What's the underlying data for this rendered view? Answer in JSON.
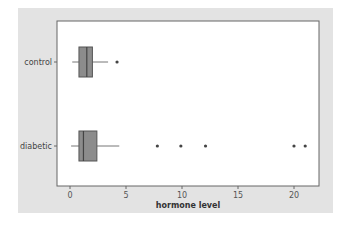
{
  "chart_data": {
    "type": "boxplot",
    "orientation": "horizontal",
    "title": "",
    "xlabel": "hormone level",
    "ylabel": "",
    "xlim": [
      -1,
      22.2
    ],
    "xticks": [
      0,
      5,
      10,
      15,
      20
    ],
    "xtick_labels": [
      "0",
      "5",
      "10",
      "15",
      "20"
    ],
    "grid": false,
    "categories": [
      "control",
      "diabetic"
    ],
    "series": [
      {
        "name": "control",
        "whisker_low": 0.2,
        "q1": 0.8,
        "median": 1.5,
        "q3": 2.0,
        "whisker_high": 3.4,
        "outliers": [
          4.2
        ]
      },
      {
        "name": "diabetic",
        "whisker_low": 0.1,
        "q1": 0.8,
        "median": 1.2,
        "q3": 2.4,
        "whisker_high": 4.4,
        "outliers": [
          7.8,
          9.9,
          12.1,
          20.0,
          21.0
        ]
      }
    ],
    "colors": {
      "panel_bg": "#e3e3e3",
      "plot_bg": "#ffffff",
      "box_fill": "#8c8c8c",
      "box_stroke": "#555555",
      "frame": "#666666"
    }
  }
}
